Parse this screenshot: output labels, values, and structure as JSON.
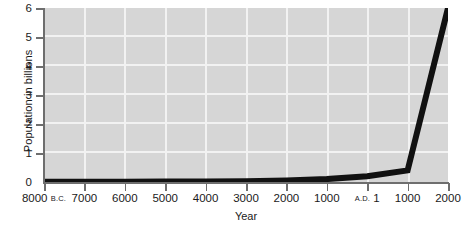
{
  "chart_data": {
    "type": "line",
    "title": "",
    "xlabel": "Year",
    "ylabel": "Population in billions",
    "ylim": [
      0,
      6
    ],
    "xlim": [
      -8000,
      2000
    ],
    "grid": true,
    "legend": "none",
    "y_ticks": [
      "0",
      "1",
      "2",
      "3",
      "4",
      "5",
      "6"
    ],
    "x_ticks": [
      {
        "label": "8000",
        "era": "B.C.",
        "value": -8000
      },
      {
        "label": "7000",
        "era": "",
        "value": -7000
      },
      {
        "label": "6000",
        "era": "",
        "value": -6000
      },
      {
        "label": "5000",
        "era": "",
        "value": -5000
      },
      {
        "label": "4000",
        "era": "",
        "value": -4000
      },
      {
        "label": "3000",
        "era": "",
        "value": -3000
      },
      {
        "label": "2000",
        "era": "",
        "value": -2000
      },
      {
        "label": "1000",
        "era": "",
        "value": -1000
      },
      {
        "label": "1",
        "era": "A.D.",
        "value": 1
      },
      {
        "label": "1000",
        "era": "",
        "value": 1000
      },
      {
        "label": "2000",
        "era": "",
        "value": 2000
      }
    ],
    "x": [
      -8000,
      -7000,
      -6000,
      -5000,
      -4000,
      -3000,
      -2000,
      -1000,
      1,
      1000,
      2000
    ],
    "values": [
      0.005,
      0.005,
      0.01,
      0.015,
      0.02,
      0.03,
      0.05,
      0.1,
      0.2,
      0.4,
      6.0
    ],
    "series": [
      {
        "name": "World population",
        "color": "#111111",
        "values": [
          0.005,
          0.005,
          0.01,
          0.015,
          0.02,
          0.03,
          0.05,
          0.1,
          0.2,
          0.4,
          6.0
        ]
      }
    ],
    "colors": {
      "plot_background": "#d6d6d6",
      "gridline": "#f2f2f2",
      "axis": "#6e6e6e",
      "line": "#111111",
      "text": "#1a1a1a"
    }
  }
}
